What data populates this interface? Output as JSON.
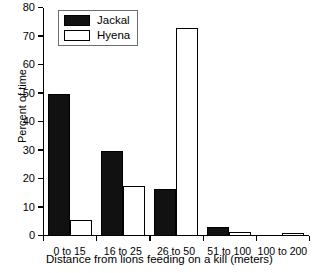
{
  "chart_data": {
    "type": "bar",
    "title": "",
    "xlabel": "Distance from lions feeding on a kill (meters)",
    "ylabel": "Percent of time",
    "categories": [
      "0 to 15",
      "16 to 25",
      "26 to 50",
      "51 to 100",
      "100 to 200"
    ],
    "series": [
      {
        "name": "Jackal",
        "color": "#111111",
        "values": [
          50,
          30,
          16.5,
          3,
          0
        ]
      },
      {
        "name": "Hyena",
        "color": "#ffffff",
        "values": [
          5.5,
          17.5,
          73,
          1.5,
          1
        ]
      }
    ],
    "ylim": [
      0,
      80
    ],
    "yticks": [
      0,
      10,
      20,
      30,
      40,
      50,
      60,
      70,
      80
    ],
    "ytick_labels": [
      "0",
      "10",
      "20",
      "30",
      "40",
      "50",
      "60",
      "70",
      "80"
    ],
    "grid": false,
    "legend_position": "upper left",
    "legend_entries": [
      "Jackal",
      "Hyena"
    ]
  }
}
